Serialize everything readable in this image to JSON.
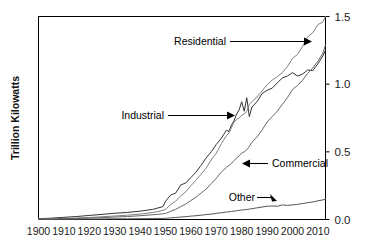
{
  "chart_data": {
    "type": "line",
    "title": "",
    "xlabel": "",
    "ylabel": "Trillion Kilowatts",
    "xlim": [
      1900,
      2013
    ],
    "ylim": [
      0.0,
      1.5
    ],
    "grid": false,
    "legend_position": "inline-annotations",
    "xticks": [
      "1900",
      "1910",
      "1920",
      "1930",
      "1940",
      "1950",
      "1960",
      "1970",
      "1980",
      "1990",
      "2000",
      "2010"
    ],
    "xtick_values": [
      1900,
      1910,
      1920,
      1930,
      1940,
      1950,
      1960,
      1970,
      1980,
      1990,
      2000,
      2010
    ],
    "yticks": [
      "0.0",
      "0.5",
      "1.0",
      "1.5"
    ],
    "ytick_values": [
      0.0,
      0.5,
      1.0,
      1.5
    ],
    "y_axis_side": "right",
    "x": [
      1900,
      1905,
      1910,
      1915,
      1920,
      1925,
      1930,
      1935,
      1940,
      1945,
      1947,
      1949,
      1950,
      1952,
      1954,
      1956,
      1958,
      1960,
      1962,
      1964,
      1966,
      1968,
      1970,
      1972,
      1974,
      1975,
      1976,
      1977,
      1978,
      1979,
      1980,
      1981,
      1982,
      1983,
      1984,
      1986,
      1988,
      1990,
      1992,
      1994,
      1996,
      1998,
      2000,
      2002,
      2004,
      2006,
      2008,
      2010,
      2012,
      2013
    ],
    "series": [
      {
        "name": "Industrial",
        "color": "#333333",
        "values": [
          0.006,
          0.01,
          0.016,
          0.022,
          0.03,
          0.038,
          0.046,
          0.052,
          0.062,
          0.075,
          0.085,
          0.095,
          0.135,
          0.18,
          0.195,
          0.255,
          0.27,
          0.31,
          0.35,
          0.4,
          0.455,
          0.5,
          0.555,
          0.6,
          0.66,
          0.65,
          0.7,
          0.73,
          0.78,
          0.81,
          0.87,
          0.8,
          0.9,
          0.76,
          0.83,
          0.87,
          0.93,
          0.955,
          0.97,
          1.01,
          1.045,
          1.06,
          1.085,
          1.06,
          1.075,
          1.105,
          1.1,
          1.15,
          1.21,
          1.25
        ]
      },
      {
        "name": "Residential",
        "color": "#808080",
        "values": [
          0.003,
          0.005,
          0.008,
          0.011,
          0.015,
          0.02,
          0.026,
          0.032,
          0.04,
          0.052,
          0.058,
          0.068,
          0.075,
          0.11,
          0.135,
          0.175,
          0.205,
          0.25,
          0.29,
          0.335,
          0.38,
          0.44,
          0.49,
          0.56,
          0.62,
          0.64,
          0.68,
          0.72,
          0.74,
          0.75,
          0.77,
          0.78,
          0.8,
          0.85,
          0.87,
          0.905,
          0.95,
          0.995,
          1.03,
          1.055,
          1.085,
          1.13,
          1.19,
          1.22,
          1.28,
          1.35,
          1.38,
          1.44,
          1.46,
          1.5
        ]
      },
      {
        "name": "Commercial",
        "color": "#666666",
        "values": [
          0.002,
          0.003,
          0.005,
          0.007,
          0.01,
          0.014,
          0.018,
          0.022,
          0.028,
          0.035,
          0.038,
          0.042,
          0.045,
          0.06,
          0.075,
          0.095,
          0.115,
          0.14,
          0.165,
          0.195,
          0.225,
          0.265,
          0.305,
          0.35,
          0.385,
          0.4,
          0.415,
          0.435,
          0.455,
          0.47,
          0.49,
          0.5,
          0.515,
          0.54,
          0.57,
          0.61,
          0.66,
          0.72,
          0.76,
          0.8,
          0.85,
          0.9,
          0.96,
          0.99,
          1.03,
          1.08,
          1.12,
          1.17,
          1.23,
          1.29
        ]
      },
      {
        "name": "Other",
        "color": "#555555",
        "values": [
          0.001,
          0.001,
          0.002,
          0.002,
          0.003,
          0.004,
          0.005,
          0.005,
          0.006,
          0.007,
          0.008,
          0.008,
          0.009,
          0.012,
          0.015,
          0.018,
          0.021,
          0.025,
          0.028,
          0.032,
          0.036,
          0.04,
          0.045,
          0.05,
          0.055,
          0.057,
          0.06,
          0.062,
          0.065,
          0.068,
          0.07,
          0.072,
          0.074,
          0.077,
          0.08,
          0.086,
          0.092,
          0.098,
          0.1,
          0.098,
          0.108,
          0.104,
          0.108,
          0.112,
          0.118,
          0.124,
          0.13,
          0.138,
          0.145,
          0.15
        ]
      }
    ],
    "annotations": [
      {
        "label": "Residential",
        "arrow": "right"
      },
      {
        "label": "Industrial",
        "arrow": "right"
      },
      {
        "label": "Commercial",
        "arrow": "left"
      },
      {
        "label": "Other",
        "arrow": "right"
      }
    ]
  }
}
